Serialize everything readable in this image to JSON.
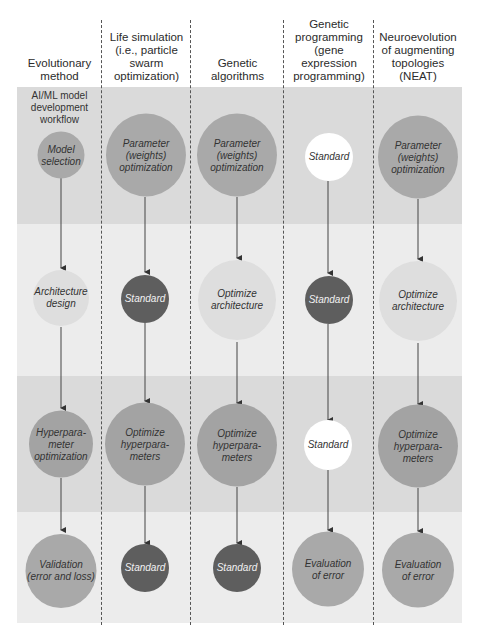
{
  "headers": [
    "Evolutionary\nmethod",
    "Life simulation\n(i.e., particle\nswarm\noptimization)",
    "Genetic\nalgorithms",
    "Genetic\nprogramming\n(gene\nexpression\nprogramming)",
    "Neuroevolution\nof augmenting\ntopologies\n(NEAT)"
  ],
  "workflow_label": "AI/ML model\ndevelopment\nworkflow",
  "colors": {
    "band_dark": "#d9d9d9",
    "band_light": "#ececec",
    "node_mid": "#a9a9a9",
    "node_light": "#dedede",
    "node_dark": "#5e5e5e",
    "node_white": "#ffffff",
    "arrow": "#333333"
  },
  "columns": [
    {
      "name": "Evolutionary method",
      "nodes": [
        {
          "label": "Model\nselection",
          "style": "mid"
        },
        {
          "label": "Architecture\ndesign",
          "style": "light"
        },
        {
          "label": "Hyperpara-\nmeter\noptimization",
          "style": "mid"
        },
        {
          "label": "Validation\n(error and loss)",
          "style": "mid"
        }
      ]
    },
    {
      "name": "Life simulation",
      "nodes": [
        {
          "label": "Parameter\n(weights)\noptimization",
          "style": "mid"
        },
        {
          "label": "Standard",
          "style": "dark"
        },
        {
          "label": "Optimize\nhyperpara-\nmeters",
          "style": "mid"
        },
        {
          "label": "Standard",
          "style": "dark"
        }
      ]
    },
    {
      "name": "Genetic algorithms",
      "nodes": [
        {
          "label": "Parameter\n(weights)\noptimization",
          "style": "mid"
        },
        {
          "label": "Optimize\narchitecture",
          "style": "light"
        },
        {
          "label": "Optimize\nhyperpara-\nmeters",
          "style": "mid"
        },
        {
          "label": "Standard",
          "style": "dark"
        }
      ]
    },
    {
      "name": "Genetic programming",
      "nodes": [
        {
          "label": "Standard",
          "style": "white"
        },
        {
          "label": "Standard",
          "style": "dark"
        },
        {
          "label": "Standard",
          "style": "white"
        },
        {
          "label": "Evaluation\nof error",
          "style": "mid"
        }
      ]
    },
    {
      "name": "NEAT",
      "nodes": [
        {
          "label": "Parameter\n(weights)\noptimization",
          "style": "mid"
        },
        {
          "label": "Optimize\narchitecture",
          "style": "light"
        },
        {
          "label": "Optimize\nhyperpara-\nmeters",
          "style": "mid"
        },
        {
          "label": "Evaluation\nof error",
          "style": "mid"
        }
      ]
    }
  ]
}
